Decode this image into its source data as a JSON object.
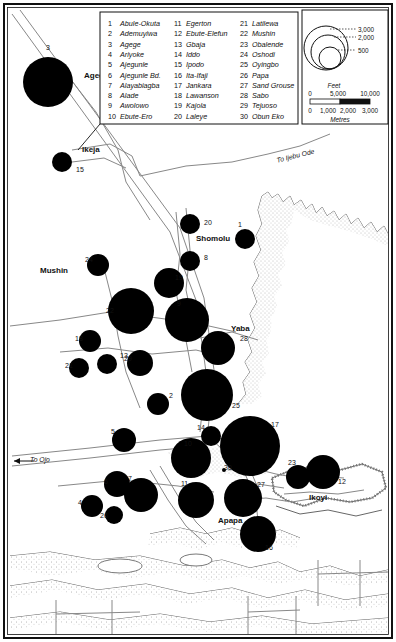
{
  "map": {
    "title": "Lagos metropolitan area proportional circle map",
    "background_color": "#ffffff",
    "ink_color": "#111111",
    "circle_fill": "#000000",
    "border": "outer rectangular frame"
  },
  "legend": {
    "columns": [
      [
        {
          "num": "1",
          "label": "Abule-Okuta"
        },
        {
          "num": "2",
          "label": "Ademuyiwa"
        },
        {
          "num": "3",
          "label": "Agege"
        },
        {
          "num": "4",
          "label": "Ariyoke"
        },
        {
          "num": "5",
          "label": "Ajegunle"
        },
        {
          "num": "6",
          "label": "Ajegunle Bd."
        },
        {
          "num": "7",
          "label": "Alayabiagba"
        },
        {
          "num": "8",
          "label": "Alade"
        },
        {
          "num": "9",
          "label": "Awolowo"
        },
        {
          "num": "10",
          "label": "Ebute-Ero"
        }
      ],
      [
        {
          "num": "11",
          "label": "Egerton"
        },
        {
          "num": "12",
          "label": "Ebute-Elefun"
        },
        {
          "num": "13",
          "label": "Gbaja"
        },
        {
          "num": "14",
          "label": "Iddo"
        },
        {
          "num": "15",
          "label": "Ipodo"
        },
        {
          "num": "16",
          "label": "Ita-Ifaji"
        },
        {
          "num": "17",
          "label": "Jankara"
        },
        {
          "num": "18",
          "label": "Lawanson"
        },
        {
          "num": "19",
          "label": "Kajola"
        },
        {
          "num": "20",
          "label": "Laleye"
        }
      ],
      [
        {
          "num": "21",
          "label": "Latilewa"
        },
        {
          "num": "22",
          "label": "Mushin"
        },
        {
          "num": "23",
          "label": "Obalende"
        },
        {
          "num": "24",
          "label": "Oshodi"
        },
        {
          "num": "25",
          "label": "Oyingbo"
        },
        {
          "num": "26",
          "label": "Papa"
        },
        {
          "num": "27",
          "label": "Sand Grouse"
        },
        {
          "num": "28",
          "label": "Sabo"
        },
        {
          "num": "29",
          "label": "Tejuoso"
        },
        {
          "num": "30",
          "label": "Obun Eko"
        }
      ]
    ]
  },
  "size_legend": {
    "name": "proportional-circle-key",
    "values": [
      "3,000",
      "2,000",
      "500"
    ]
  },
  "scale_bar": {
    "top_unit": "Feet",
    "top_ticks": [
      "0",
      "5,000",
      "10,000"
    ],
    "bottom_unit": "Metres",
    "bottom_ticks": [
      "0",
      "1,000",
      "2,000",
      "3,000"
    ]
  },
  "place_labels": [
    {
      "name": "Agege",
      "x": 84,
      "y": 78
    },
    {
      "name": "Ikeja",
      "x": 82,
      "y": 152
    },
    {
      "name": "Mushin",
      "x": 40,
      "y": 273
    },
    {
      "name": "Shomolu",
      "x": 196,
      "y": 241
    },
    {
      "name": "Yaba",
      "x": 231,
      "y": 331
    },
    {
      "name": "Apapa",
      "x": 218,
      "y": 523
    },
    {
      "name": "Ikoyi",
      "x": 309,
      "y": 500
    }
  ],
  "road_labels": [
    {
      "name": "To Ijebu Ode",
      "x": 296,
      "y": 158,
      "rotate": -14
    },
    {
      "name": "To Ojo",
      "x": 40,
      "y": 462,
      "rotate": 0
    }
  ],
  "circles": [
    {
      "num": "3",
      "cx": 48,
      "cy": 82,
      "r": 25,
      "lx": 46,
      "ly": 50
    },
    {
      "num": "15",
      "cx": 62,
      "cy": 162,
      "r": 10,
      "lx": 76,
      "ly": 172
    },
    {
      "num": "20",
      "cx": 190,
      "cy": 224,
      "r": 10,
      "lx": 204,
      "ly": 225
    },
    {
      "num": "1",
      "cx": 245,
      "cy": 239,
      "r": 10,
      "lx": 238,
      "ly": 227
    },
    {
      "num": "8",
      "cx": 190,
      "cy": 261,
      "r": 10,
      "lx": 204,
      "ly": 260
    },
    {
      "num": "24",
      "cx": 98,
      "cy": 265,
      "r": 11,
      "lx": 85,
      "ly": 262
    },
    {
      "num": "19",
      "cx": 169,
      "cy": 283,
      "r": 15,
      "lx": 175,
      "ly": 280
    },
    {
      "num": "9",
      "cx": 187,
      "cy": 320,
      "r": 22,
      "lx": 177,
      "ly": 306
    },
    {
      "num": "22",
      "cx": 131,
      "cy": 311,
      "r": 23,
      "lx": 106,
      "ly": 313
    },
    {
      "num": "18",
      "cx": 90,
      "cy": 341,
      "r": 11,
      "lx": 75,
      "ly": 341
    },
    {
      "num": "13",
      "cx": 107,
      "cy": 364,
      "r": 10,
      "lx": 120,
      "ly": 358
    },
    {
      "num": "29",
      "cx": 140,
      "cy": 363,
      "r": 13,
      "lx": 124,
      "ly": 361
    },
    {
      "num": "21",
      "cx": 79,
      "cy": 368,
      "r": 10,
      "lx": 65,
      "ly": 368
    },
    {
      "num": "28",
      "cx": 218,
      "cy": 348,
      "r": 17,
      "lx": 240,
      "ly": 341
    },
    {
      "num": "2",
      "cx": 158,
      "cy": 404,
      "r": 11,
      "lx": 169,
      "ly": 398
    },
    {
      "num": "25",
      "cx": 207,
      "cy": 395,
      "r": 26,
      "lx": 232,
      "ly": 408
    },
    {
      "num": "14",
      "cx": 211,
      "cy": 436,
      "r": 10,
      "lx": 197,
      "ly": 430
    },
    {
      "num": "10",
      "cx": 191,
      "cy": 458,
      "r": 20,
      "lx": 184,
      "ly": 446
    },
    {
      "num": "17",
      "cx": 250,
      "cy": 446,
      "r": 30,
      "lx": 271,
      "ly": 427
    },
    {
      "num": "5",
      "cx": 124,
      "cy": 440,
      "r": 12,
      "lx": 111,
      "ly": 434
    },
    {
      "num": "7",
      "cx": 141,
      "cy": 495,
      "r": 17,
      "lx": 128,
      "ly": 481
    },
    {
      "num": "6",
      "cx": 117,
      "cy": 484,
      "r": 13,
      "lx": 104,
      "ly": 484
    },
    {
      "num": "4",
      "cx": 92,
      "cy": 506,
      "r": 11,
      "lx": 78,
      "ly": 505
    },
    {
      "num": "26",
      "cx": 114,
      "cy": 515,
      "r": 9,
      "lx": 100,
      "ly": 518
    },
    {
      "num": "11",
      "cx": 196,
      "cy": 500,
      "r": 18,
      "lx": 181,
      "ly": 486
    },
    {
      "num": "27",
      "cx": 243,
      "cy": 498,
      "r": 19,
      "lx": 257,
      "ly": 487
    },
    {
      "num": "23",
      "cx": 298,
      "cy": 477,
      "r": 12,
      "lx": 288,
      "ly": 465
    },
    {
      "num": "12",
      "cx": 323,
      "cy": 472,
      "r": 17,
      "lx": 338,
      "ly": 484
    },
    {
      "num": "16",
      "cx": 258,
      "cy": 534,
      "r": 18,
      "lx": 265,
      "ly": 550
    },
    {
      "num": "30",
      "cx": 224,
      "cy": 470,
      "r": 2,
      "lx": 224,
      "ly": 470
    }
  ]
}
